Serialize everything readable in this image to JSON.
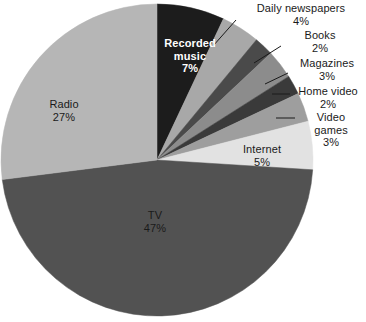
{
  "chart_data": {
    "type": "pie",
    "title": "",
    "subtitle": "",
    "xlabel": "",
    "ylabel": "",
    "legend_position": "none",
    "grid": false,
    "units": "percent",
    "total": 100,
    "categories": [
      "Recorded music",
      "Daily  newspapers",
      "Books",
      "Magazines",
      "Home video",
      "Video games",
      "Internet",
      "TV",
      "Radio"
    ],
    "values": [
      7,
      4,
      2,
      3,
      2,
      3,
      5,
      47,
      27
    ],
    "start_angle_deg": 0,
    "direction": "clockwise",
    "slices": [
      {
        "label": "Recorded music",
        "value": 7,
        "percent_text": "7%",
        "color": "#1c1c1c",
        "label_placement": "inside",
        "label_style": "on-dark"
      },
      {
        "label": "Daily  newspapers",
        "value": 4,
        "percent_text": "4%",
        "color": "#a8a8a8",
        "label_placement": "callout",
        "leader": "diagonal"
      },
      {
        "label": "Books",
        "value": 2,
        "percent_text": "2%",
        "color": "#4a4a4a",
        "label_placement": "callout",
        "leader": "diagonal"
      },
      {
        "label": "Magazines",
        "value": 3,
        "percent_text": "3%",
        "color": "#8c8c8c",
        "label_placement": "callout",
        "leader": "diagonal"
      },
      {
        "label": "Home video",
        "value": 2,
        "percent_text": "2%",
        "color": "#3a3a3a",
        "label_placement": "callout",
        "leader": "horizontal"
      },
      {
        "label": "Video games",
        "value": 3,
        "percent_text": "3%",
        "color": "#9e9e9e",
        "label_placement": "callout",
        "leader": "horizontal"
      },
      {
        "label": "Internet",
        "value": 5,
        "percent_text": "5%",
        "color": "#e2e2e2",
        "label_placement": "inside",
        "label_style": "on-light"
      },
      {
        "label": "TV",
        "value": 47,
        "percent_text": "47%",
        "color": "#525252",
        "label_placement": "inside",
        "label_style": "on-light"
      },
      {
        "label": "Radio",
        "value": 27,
        "percent_text": "27%",
        "color": "#b6b6b6",
        "label_placement": "inside",
        "label_style": "on-light"
      }
    ]
  },
  "labels": {
    "recorded_music": {
      "cat_line1": "Recorded",
      "cat_line2": "music",
      "pct": "7%"
    },
    "daily_newspapers": {
      "cat": "Daily  newspapers",
      "pct": "4%"
    },
    "books": {
      "cat": "Books",
      "pct": "2%"
    },
    "magazines": {
      "cat": "Magazines",
      "pct": "3%"
    },
    "home_video": {
      "cat": "Home video",
      "pct": "2%"
    },
    "video_games": {
      "cat_line1": "Video",
      "cat_line2": "games",
      "pct": "3%"
    },
    "internet": {
      "cat": "Internet",
      "pct": "5%"
    },
    "tv": {
      "cat": "TV",
      "pct": "47%"
    },
    "radio": {
      "cat": "Radio",
      "pct": "27%"
    }
  }
}
